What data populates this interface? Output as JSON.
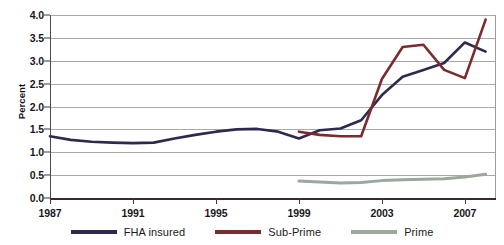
{
  "chart_data": {
    "type": "line",
    "title": "",
    "subtitle": "",
    "xlabel": "",
    "ylabel": "Percent",
    "xlim": [
      1987,
      2008.5
    ],
    "ylim": [
      0.0,
      4.0
    ],
    "grid": true,
    "legend_position": "bottom",
    "x_ticks": [
      1987,
      1991,
      1995,
      1999,
      2003,
      2007
    ],
    "x_tick_labels": [
      "1987",
      "1991",
      "1995",
      "1999",
      "2003",
      "2007"
    ],
    "y_ticks": [
      0.0,
      0.5,
      1.0,
      1.5,
      2.0,
      2.5,
      3.0,
      3.5,
      4.0
    ],
    "y_tick_labels": [
      "0.0",
      "0.5",
      "1.0",
      "1.5",
      "2.0",
      "2.5",
      "3.0",
      "3.5",
      "4.0"
    ],
    "series": [
      {
        "name": "FHA insured",
        "color": "#2e2a4e",
        "x": [
          1987,
          1988,
          1989,
          1990,
          1991,
          1992,
          1993,
          1994,
          1995,
          1996,
          1997,
          1998,
          1999,
          2000,
          2001,
          2002,
          2003,
          2004,
          2005,
          2006,
          2007,
          2008
        ],
        "values": [
          1.35,
          1.27,
          1.23,
          1.21,
          1.2,
          1.21,
          1.3,
          1.38,
          1.45,
          1.5,
          1.51,
          1.45,
          1.3,
          1.48,
          1.52,
          1.7,
          2.25,
          2.65,
          2.8,
          2.95,
          3.4,
          3.2
        ]
      },
      {
        "name": "Sub-Prime",
        "color": "#7b2b2e",
        "x": [
          1999,
          2000,
          2001,
          2002,
          2003,
          2004,
          2005,
          2006,
          2007,
          2008
        ],
        "values": [
          1.45,
          1.38,
          1.35,
          1.35,
          2.6,
          3.3,
          3.35,
          2.8,
          2.62,
          3.9
        ]
      },
      {
        "name": "Prime",
        "color": "#9aa89e",
        "x": [
          1999,
          2000,
          2001,
          2002,
          2003,
          2004,
          2005,
          2006,
          2007,
          2008
        ],
        "values": [
          0.37,
          0.35,
          0.33,
          0.34,
          0.38,
          0.4,
          0.41,
          0.42,
          0.46,
          0.52
        ]
      }
    ]
  },
  "legend": {
    "items": [
      {
        "label": "FHA insured",
        "color": "#2e2a4e"
      },
      {
        "label": "Sub-Prime",
        "color": "#7b2b2e"
      },
      {
        "label": "Prime",
        "color": "#9aa89e"
      }
    ]
  },
  "axis": {
    "y_title": "Percent"
  }
}
